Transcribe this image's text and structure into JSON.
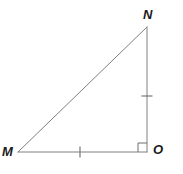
{
  "figure": {
    "kind": "geometry-diagram",
    "shape": "right-triangle",
    "name": "Triangle MNO",
    "canvas": {
      "width": 183,
      "height": 174,
      "background": "#ffffff"
    },
    "stroke_color": "#808080",
    "stroke_width": 1,
    "label_color": "#1a1a1a"
  },
  "labels": {
    "M": "M",
    "N": "N",
    "O": "O"
  },
  "vertices": [
    {
      "id": "M",
      "label": "M",
      "x": 18,
      "y": 152
    },
    {
      "id": "N",
      "label": "N",
      "x": 147,
      "y": 27
    },
    {
      "id": "O",
      "label": "O",
      "x": 147,
      "y": 152
    }
  ],
  "sides": [
    {
      "id": "MN",
      "from": "M",
      "to": "N",
      "role": "hypotenuse",
      "tick_marks": 0
    },
    {
      "id": "NO",
      "from": "N",
      "to": "O",
      "role": "leg",
      "tick_marks": 1
    },
    {
      "id": "MO",
      "from": "M",
      "to": "O",
      "role": "leg",
      "tick_marks": 1
    }
  ],
  "tick_marks": [
    {
      "on_side": "MO",
      "x": 80,
      "y": 152,
      "orientation": "vertical",
      "length": 11
    },
    {
      "on_side": "NO",
      "x": 147,
      "y": 96,
      "orientation": "horizontal",
      "length": 11
    }
  ],
  "angle_markers": [
    {
      "at_vertex": "O",
      "type": "right-angle-square",
      "size": 9,
      "x": 138,
      "y": 140
    }
  ]
}
